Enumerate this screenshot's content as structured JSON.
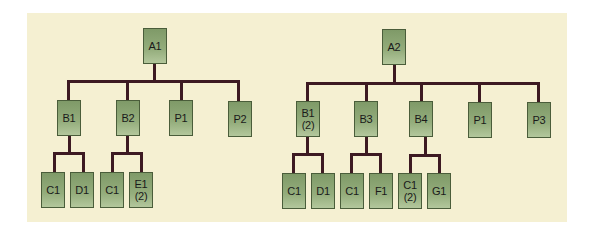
{
  "diagram": {
    "type": "tree",
    "background_color": "#f5f0d2",
    "node_color": "#8ea676",
    "connector_color": "#3d1a22",
    "trees": [
      {
        "root": "A1",
        "children": [
          {
            "label": "B1",
            "qty": "",
            "children": [
              {
                "label": "C1",
                "qty": ""
              },
              {
                "label": "D1",
                "qty": ""
              }
            ]
          },
          {
            "label": "B2",
            "qty": "",
            "children": [
              {
                "label": "C1",
                "qty": ""
              },
              {
                "label": "E1",
                "qty": "(2)"
              }
            ]
          },
          {
            "label": "P1",
            "qty": "",
            "children": []
          },
          {
            "label": "P2",
            "qty": "",
            "children": []
          }
        ]
      },
      {
        "root": "A2",
        "children": [
          {
            "label": "B1",
            "qty": "(2)",
            "children": [
              {
                "label": "C1",
                "qty": ""
              },
              {
                "label": "D1",
                "qty": ""
              }
            ]
          },
          {
            "label": "B3",
            "qty": "",
            "children": [
              {
                "label": "C1",
                "qty": ""
              },
              {
                "label": "F1",
                "qty": ""
              }
            ]
          },
          {
            "label": "B4",
            "qty": "",
            "children": [
              {
                "label": "C1",
                "qty": "(2)"
              },
              {
                "label": "G1",
                "qty": ""
              }
            ]
          },
          {
            "label": "P1",
            "qty": "",
            "children": []
          },
          {
            "label": "P3",
            "qty": "",
            "children": []
          }
        ]
      }
    ]
  }
}
